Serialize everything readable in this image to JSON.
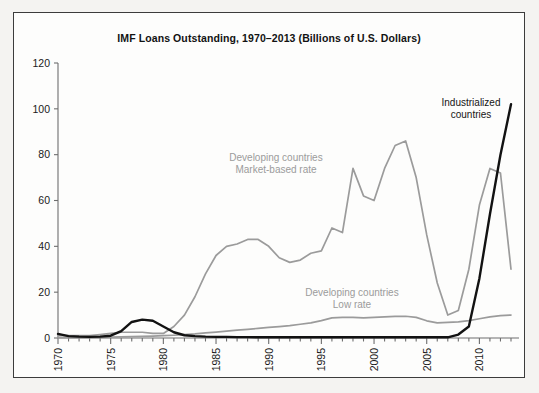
{
  "figure": {
    "title": "IMF Loans Outstanding, 1970–2013 (Billions of U.S. Dollars)",
    "caption_partial": "",
    "border_color": "#3c3c3c",
    "background_color": "#fdfdfc"
  },
  "chart_data": {
    "type": "line",
    "title": "IMF Loans Outstanding, 1970–2013 (Billions of U.S. Dollars)",
    "xlabel": "",
    "ylabel": "",
    "xlim": [
      1970,
      2013
    ],
    "ylim": [
      0,
      120
    ],
    "yticks": [
      0,
      20,
      40,
      60,
      80,
      100,
      120
    ],
    "ytick_labels": [
      "0",
      "20",
      "40",
      "60",
      "80",
      "100",
      "120"
    ],
    "xticks": [
      1970,
      1975,
      1980,
      1985,
      1990,
      1995,
      2000,
      2005,
      2010
    ],
    "xtick_labels": [
      "1970",
      "1975",
      "1980",
      "1985",
      "1990",
      "1995",
      "2000",
      "2005",
      "2010"
    ],
    "xtick_rotation": 90,
    "minor_xticks_every": 1,
    "grid": false,
    "legend": "annotations-on-plot",
    "x": [
      1970,
      1971,
      1972,
      1973,
      1974,
      1975,
      1976,
      1977,
      1978,
      1979,
      1980,
      1981,
      1982,
      1983,
      1984,
      1985,
      1986,
      1987,
      1988,
      1989,
      1990,
      1991,
      1992,
      1993,
      1994,
      1995,
      1996,
      1997,
      1998,
      1999,
      2000,
      2001,
      2002,
      2003,
      2004,
      2005,
      2006,
      2007,
      2008,
      2009,
      2010,
      2011,
      2012,
      2013
    ],
    "series": [
      {
        "name": "Developing countries Market-based rate",
        "color": "#9b9b9b",
        "label_line1": "Developing countries",
        "label_line2": "Market-based rate",
        "label_color": "#9b9b9b",
        "values": [
          1.0,
          1.0,
          1.0,
          1.0,
          1.5,
          2.0,
          2.5,
          2.5,
          2.5,
          2.0,
          2.0,
          5.0,
          10.0,
          18.0,
          28.0,
          36.0,
          40.0,
          41.0,
          43.0,
          43.0,
          40.0,
          35.0,
          33.0,
          34.0,
          37.0,
          38.0,
          48.0,
          46.0,
          74.0,
          62.0,
          60.0,
          74.0,
          84.0,
          86.0,
          70.0,
          45.0,
          24.0,
          10.0,
          12.0,
          30.0,
          58.0,
          74.0,
          72.0,
          30.0
        ]
      },
      {
        "name": "Developing countries Low rate",
        "color": "#9b9b9b",
        "label_line1": "Developing countries",
        "label_line2": "Low rate",
        "label_color": "#9b9b9b",
        "values": [
          0.2,
          0.2,
          0.2,
          0.2,
          0.3,
          0.4,
          0.5,
          0.6,
          0.7,
          0.8,
          1.0,
          1.2,
          1.5,
          1.8,
          2.2,
          2.6,
          3.0,
          3.4,
          3.8,
          4.2,
          4.6,
          5.0,
          5.4,
          6.0,
          6.6,
          7.6,
          8.8,
          9.0,
          9.0,
          8.8,
          9.0,
          9.2,
          9.4,
          9.5,
          9.0,
          7.5,
          6.6,
          6.8,
          7.0,
          7.6,
          8.4,
          9.2,
          9.8,
          10.0
        ]
      },
      {
        "name": "Industrialized countries",
        "color": "#121212",
        "label_line1": "Industrialized",
        "label_line2": "countries",
        "label_color": "#151515",
        "values": [
          1.8,
          0.8,
          0.6,
          0.5,
          0.6,
          1.0,
          3.0,
          7.0,
          8.0,
          7.5,
          5.0,
          2.5,
          1.2,
          0.8,
          0.6,
          0.5,
          0.5,
          0.4,
          0.4,
          0.3,
          0.3,
          0.3,
          0.3,
          0.3,
          0.3,
          0.3,
          0.3,
          0.3,
          0.3,
          0.3,
          0.3,
          0.3,
          0.3,
          0.3,
          0.3,
          0.3,
          0.3,
          0.3,
          1.5,
          5.0,
          26.0,
          54.0,
          80.0,
          102.0
        ]
      }
    ]
  }
}
